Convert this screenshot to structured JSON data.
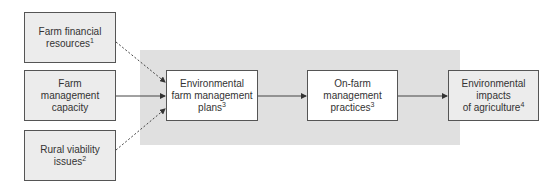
{
  "diagram": {
    "inputs": [
      {
        "id": "financial",
        "lines": [
          "Farm financial",
          "resources"
        ],
        "sup": "1"
      },
      {
        "id": "capacity",
        "lines": [
          "Farm",
          "management",
          "capacity"
        ],
        "sup": ""
      },
      {
        "id": "rural",
        "lines": [
          "Rural viability",
          "issues"
        ],
        "sup": "2"
      }
    ],
    "process": [
      {
        "id": "plans",
        "lines": [
          "Environmental",
          "farm management",
          "plans"
        ],
        "sup": "3"
      },
      {
        "id": "practices",
        "lines": [
          "On-farm",
          "management",
          "practices"
        ],
        "sup": "3"
      }
    ],
    "output": {
      "id": "impacts",
      "lines": [
        "Environmental",
        "impacts",
        "of agriculture"
      ],
      "sup": "4"
    },
    "edges": [
      {
        "from": "financial",
        "to": "plans",
        "style": "dashed"
      },
      {
        "from": "capacity",
        "to": "plans",
        "style": "solid"
      },
      {
        "from": "rural",
        "to": "plans",
        "style": "dashed"
      },
      {
        "from": "plans",
        "to": "practices",
        "style": "solid"
      },
      {
        "from": "practices",
        "to": "impacts",
        "style": "solid"
      }
    ],
    "colors": {
      "box_gray": "#ececec",
      "highlight_bg": "#e0e0e0",
      "stroke": "#555555"
    }
  }
}
